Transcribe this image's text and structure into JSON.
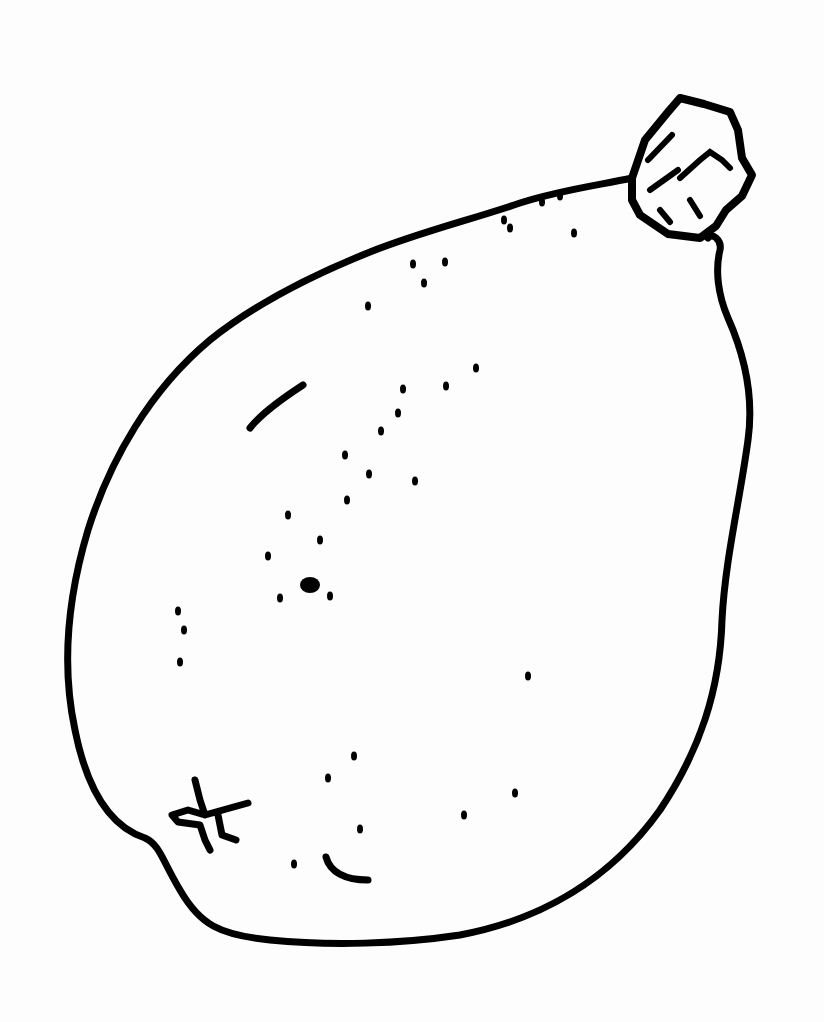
{
  "image": {
    "subject": "Line drawing of a pear-shaped fruit with stem",
    "background": "#fdfdfd",
    "stroke_color": "#000000",
    "width": 824,
    "height": 1022
  },
  "drawing": {
    "outline": "M 632 178 C 600 185, 560 190, 520 203 C 470 220, 420 232, 370 252 C 320 272, 260 300, 210 340 C 150 390, 110 460, 88 530 C 70 590, 60 660, 75 730 C 85 780, 105 825, 145 838 C 160 845, 162 860, 180 890 C 200 925, 220 935, 270 940 C 330 946, 400 944, 460 935 C 540 920, 610 880, 660 810 C 700 750, 720 690, 722 620 C 725 560, 740 500, 748 440 C 755 390, 740 345, 728 318 C 718 295, 715 270, 720 250 C 722 240, 712 232, 708 238",
    "stem": "M 632 178 L 645 140 L 668 112 L 680 98 L 704 104 L 730 112 L 738 130 L 742 158 L 752 175 L 742 196 L 726 210 L 716 226 L 700 238 L 668 234 L 640 215 L 632 200 Z",
    "stem_details": [
      "M 648 160 L 672 135",
      "M 650 190 L 678 170",
      "M 680 178 L 700 160 L 710 152 L 722 160 L 730 168",
      "M 660 210 L 670 222",
      "M 690 200 L 700 216"
    ],
    "blossom_mark": "M 195 780 L 200 800 L 205 815 L 188 810 L 172 815 L 178 822 L 200 825 L 205 840 L 210 850 M 205 815 L 230 808 L 248 803 M 218 815 L 222 835 L 236 840",
    "highlight_arc": "M 250 428 C 260 415, 280 400, 303 385",
    "bottom_arc": "M 326 857 C 330 872, 345 880, 368 880",
    "speckles": [
      [
        413,
        264
      ],
      [
        445,
        262
      ],
      [
        424,
        283
      ],
      [
        368,
        306
      ],
      [
        476,
        368
      ],
      [
        446,
        386
      ],
      [
        403,
        389
      ],
      [
        398,
        413
      ],
      [
        381,
        431
      ],
      [
        345,
        455
      ],
      [
        369,
        474
      ],
      [
        415,
        481
      ],
      [
        347,
        500
      ],
      [
        288,
        515
      ],
      [
        320,
        540
      ],
      [
        268,
        556
      ],
      [
        310,
        585
      ],
      [
        280,
        598
      ],
      [
        330,
        596
      ],
      [
        178,
        611
      ],
      [
        184,
        630
      ],
      [
        180,
        662
      ],
      [
        528,
        676
      ],
      [
        354,
        756
      ],
      [
        328,
        778
      ],
      [
        515,
        793
      ],
      [
        464,
        815
      ],
      [
        360,
        829
      ],
      [
        294,
        864
      ],
      [
        504,
        220
      ],
      [
        510,
        228
      ],
      [
        574,
        233
      ],
      [
        542,
        202
      ],
      [
        560,
        196
      ]
    ]
  }
}
